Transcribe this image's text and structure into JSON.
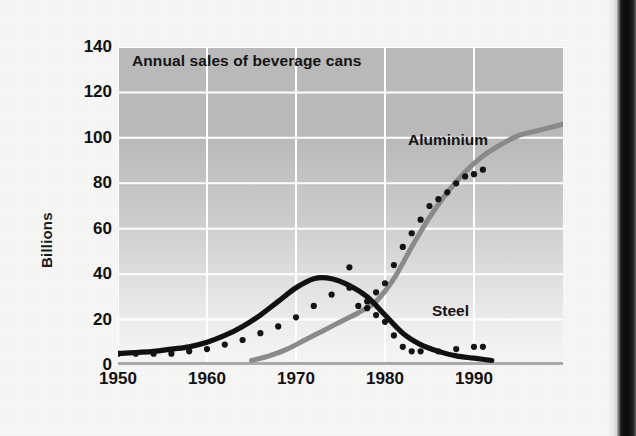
{
  "figure": {
    "title": "Annual sales of beverage cans",
    "ylabel": "Billions",
    "series_labels": {
      "aluminium": "Aluminium",
      "steel": "Steel"
    }
  },
  "colors": {
    "steel_line": "#101010",
    "aluminium_line": "#8a8a8a",
    "marker": "#141414",
    "gridline": "#ffffff",
    "plot_bg_top": "#b9b9b9",
    "plot_bg_bottom": "#f4f4f4",
    "page_bg": "#f7f7f5",
    "spine": "#0a0a0a",
    "text": "#111111"
  },
  "chart_data": {
    "type": "line",
    "title": "Annual sales of beverage cans",
    "xlabel": "",
    "ylabel": "Billions",
    "xlim": [
      1950,
      2000
    ],
    "ylim": [
      0,
      140
    ],
    "yticks": [
      0,
      20,
      40,
      60,
      80,
      100,
      120,
      140
    ],
    "xticks": [
      1950,
      1960,
      1970,
      1980,
      1990
    ],
    "grid": true,
    "legend_position": "inline-annotation",
    "annotations": [
      {
        "text": "Aluminium",
        "x": 1987,
        "y": 96
      },
      {
        "text": "Steel",
        "x": 1990,
        "y": 17
      }
    ],
    "series": [
      {
        "name": "Steel",
        "style": "smooth-line",
        "color": "#101010",
        "x": [
          1950,
          1952,
          1954,
          1956,
          1958,
          1960,
          1962,
          1964,
          1966,
          1968,
          1970,
          1972,
          1974,
          1976,
          1978,
          1980,
          1982,
          1984,
          1986,
          1988,
          1990,
          1992
        ],
        "values": [
          5,
          5.5,
          6,
          7,
          8,
          10,
          13,
          17,
          22,
          28,
          34,
          38,
          38,
          35,
          30,
          22,
          14,
          9,
          6,
          4,
          3,
          2
        ]
      },
      {
        "name": "Aluminium",
        "style": "smooth-line",
        "color": "#8a8a8a",
        "x": [
          1965,
          1967,
          1969,
          1971,
          1973,
          1975,
          1977,
          1979,
          1981,
          1983,
          1985,
          1987,
          1989,
          1991,
          1993,
          1995,
          1997,
          1999,
          2000
        ],
        "values": [
          2,
          4,
          7,
          11,
          15,
          19,
          23,
          28,
          38,
          52,
          65,
          76,
          85,
          92,
          97,
          101,
          103,
          105,
          106
        ]
      },
      {
        "name": "Steel (data points)",
        "style": "dots",
        "color": "#141414",
        "x": [
          1950,
          1952,
          1954,
          1956,
          1958,
          1960,
          1962,
          1964,
          1966,
          1968,
          1970,
          1972,
          1974,
          1976,
          1978,
          1979,
          1980,
          1981,
          1982,
          1983,
          1984,
          1986,
          1988,
          1990,
          1991
        ],
        "values": [
          5,
          5,
          5,
          5,
          6,
          7,
          9,
          11,
          14,
          17,
          21,
          26,
          31,
          34,
          25,
          22,
          19,
          13,
          8,
          6,
          6,
          6,
          7,
          8,
          8
        ]
      },
      {
        "name": "Aluminium (data points)",
        "style": "dots",
        "color": "#141414",
        "x": [
          1976,
          1977,
          1978,
          1979,
          1980,
          1981,
          1982,
          1983,
          1984,
          1985,
          1986,
          1987,
          1988,
          1989,
          1990,
          1991
        ],
        "values": [
          43,
          26,
          28,
          32,
          36,
          44,
          52,
          58,
          64,
          70,
          73,
          76,
          80,
          83,
          84,
          86
        ]
      }
    ]
  }
}
